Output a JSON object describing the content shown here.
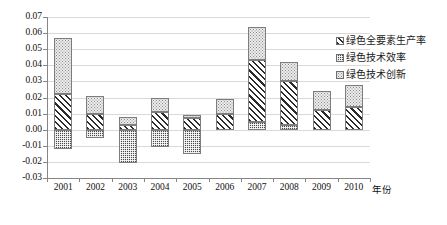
{
  "chart_data": {
    "type": "bar",
    "stacked": true,
    "title": "",
    "xlabel": "年份",
    "ylabel": "",
    "ylim": [
      -0.03,
      0.07
    ],
    "ytick_step": 0.01,
    "grid": true,
    "legend_position": "right",
    "categories": [
      "2001",
      "2002",
      "2003",
      "2004",
      "2005",
      "2006",
      "2007",
      "2008",
      "2009",
      "2010"
    ],
    "yticks": [
      "0.07",
      "0.06",
      "0.05",
      "0.04",
      "0.03",
      "0.02",
      "0.01",
      "0.00",
      "-0.01",
      "-0.02",
      "-0.03"
    ],
    "series": [
      {
        "name": "绿色全要素生产率",
        "pattern": "diagonal-hatch",
        "values": [
          0.022,
          0.01,
          0.003,
          0.011,
          0.007,
          0.01,
          0.038,
          0.027,
          0.012,
          0.014
        ]
      },
      {
        "name": "绿色技术效率",
        "pattern": "dark-checker",
        "values": [
          -0.012,
          -0.005,
          -0.021,
          -0.011,
          -0.015,
          0.0,
          0.005,
          0.003,
          0.0,
          0.0
        ]
      },
      {
        "name": "绿色技术创新",
        "pattern": "light-dots",
        "values": [
          0.035,
          0.011,
          0.005,
          0.009,
          0.002,
          0.009,
          0.021,
          0.012,
          0.012,
          0.014
        ]
      }
    ]
  },
  "legend": {
    "items": [
      {
        "label": "绿色全要素生产率"
      },
      {
        "label": "绿色技术效率"
      },
      {
        "label": "绿色技术创新"
      }
    ]
  },
  "colors": {
    "axis": "#868686",
    "grid": "#d9d9d9",
    "text": "#111111",
    "hatch": "#2b2b2b",
    "dark_fill": "#4a4a4a",
    "light_fill": "#ededed"
  }
}
